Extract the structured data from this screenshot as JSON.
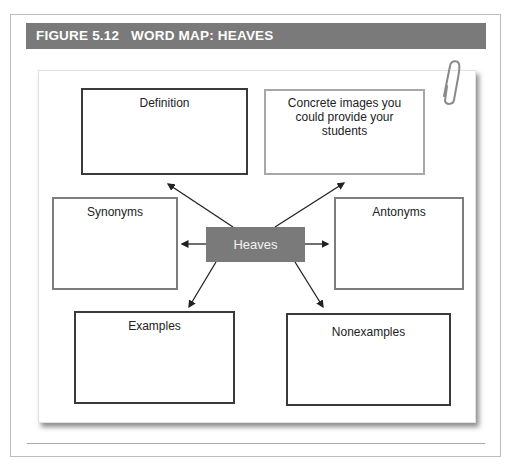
{
  "figure": {
    "label": "FIGURE 5.12",
    "title": "WORD MAP: HEAVES",
    "header_text": "FIGURE 5.12   WORD MAP: HEAVES"
  },
  "word_map": {
    "center_word": "Heaves",
    "boxes": {
      "definition": "Definition",
      "concrete_images": "Concrete images you could provide your students",
      "synonyms": "Synonyms",
      "antonyms": "Antonyms",
      "examples": "Examples",
      "nonexamples": "Nonexamples"
    }
  },
  "colors": {
    "header_bg": "#7a7a7a",
    "center_bg": "#7a7a7a",
    "dark_border": "#3a3a3a",
    "light_border": "#a8a8a8"
  },
  "icons": {
    "paperclip": "paperclip-icon"
  }
}
